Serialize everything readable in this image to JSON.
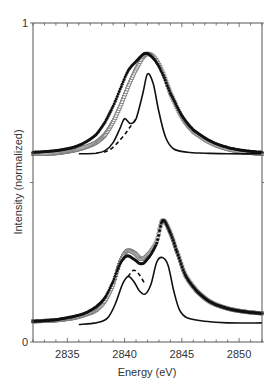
{
  "chart_data": {
    "type": "line",
    "title": "",
    "xlabel": "Energy (eV)",
    "ylabel": "Intensity (normalized)",
    "xlim": [
      2832,
      2852
    ],
    "ylim": [
      0,
      1
    ],
    "x_ticks": [
      2835,
      2840,
      2845,
      2850
    ],
    "x_tick_labels": [
      "2835",
      "2840",
      "2845",
      "2850"
    ],
    "y_ticks": [
      0,
      0.5,
      1
    ],
    "y_tick_labels": [
      "0",
      "",
      "1"
    ],
    "grid": false,
    "legend": null,
    "panels": [
      {
        "name": "upper",
        "series": [
          {
            "name": "filled-markers",
            "style": "filled-circles",
            "x": [
              2832.0,
              2834,
              2835.5,
              2836.5,
              2837.5,
              2838.3,
              2839.0,
              2839.7,
              2840.3,
              2841.0,
              2841.8,
              2842.5,
              2843.2,
              2844.0,
              2845.0,
              2846.0,
              2847.5,
              2849.0,
              2850.5,
              2852.0
            ],
            "y": [
              0.595,
              0.6,
              0.61,
              0.625,
              0.65,
              0.69,
              0.74,
              0.8,
              0.85,
              0.88,
              0.905,
              0.89,
              0.85,
              0.78,
              0.71,
              0.665,
              0.63,
              0.61,
              0.6,
              0.595
            ]
          },
          {
            "name": "open-markers",
            "style": "open-squares",
            "x": [
              2832.0,
              2834,
              2835.5,
              2836.5,
              2837.5,
              2838.3,
              2839.0,
              2839.7,
              2840.3,
              2841.0,
              2841.8,
              2842.5,
              2843.2,
              2844.0,
              2845.0,
              2846.0,
              2847.5,
              2849.0,
              2850.5,
              2852.0
            ],
            "y": [
              0.59,
              0.592,
              0.6,
              0.61,
              0.625,
              0.65,
              0.69,
              0.745,
              0.8,
              0.855,
              0.9,
              0.895,
              0.855,
              0.78,
              0.705,
              0.66,
              0.625,
              0.605,
              0.595,
              0.59
            ]
          },
          {
            "name": "solid-line",
            "style": "solid",
            "x": [
              2836.0,
              2837.5,
              2838.3,
              2839.0,
              2839.6,
              2840.0,
              2840.5,
              2841.0,
              2841.6,
              2842.0,
              2842.5,
              2843.0,
              2843.6,
              2844.3,
              2845.5,
              2847.0,
              2849.0,
              2852.0
            ],
            "y": [
              0.59,
              0.592,
              0.6,
              0.625,
              0.67,
              0.7,
              0.685,
              0.7,
              0.78,
              0.84,
              0.81,
              0.72,
              0.64,
              0.605,
              0.595,
              0.592,
              0.59,
              0.59
            ]
          },
          {
            "name": "dashed-line",
            "style": "dashed",
            "x": [
              2838.2,
              2838.8,
              2839.4,
              2840.0,
              2840.5,
              2841.0
            ],
            "y": [
              0.595,
              0.605,
              0.625,
              0.65,
              0.675,
              0.7
            ]
          }
        ]
      },
      {
        "name": "lower",
        "series": [
          {
            "name": "filled-markers",
            "style": "filled-circles",
            "x": [
              2832.0,
              2834,
              2835.5,
              2836.5,
              2837.5,
              2838.3,
              2839.0,
              2839.6,
              2840.2,
              2840.8,
              2841.5,
              2842.2,
              2842.8,
              2843.3,
              2843.9,
              2844.5,
              2845.3,
              2846.3,
              2847.5,
              2849.0,
              2850.5,
              2852.0
            ],
            "y": [
              0.065,
              0.07,
              0.08,
              0.09,
              0.11,
              0.14,
              0.19,
              0.245,
              0.27,
              0.26,
              0.245,
              0.27,
              0.31,
              0.38,
              0.35,
              0.29,
              0.21,
              0.16,
              0.125,
              0.105,
              0.095,
              0.09
            ]
          },
          {
            "name": "open-markers",
            "style": "open-squares",
            "x": [
              2832.0,
              2834,
              2835.5,
              2836.5,
              2837.5,
              2838.3,
              2839.0,
              2839.6,
              2840.2,
              2840.8,
              2841.5,
              2842.2,
              2842.8,
              2843.3,
              2843.9,
              2844.5,
              2845.3,
              2846.3,
              2847.5,
              2849.0,
              2850.5,
              2852.0
            ],
            "y": [
              0.065,
              0.068,
              0.075,
              0.085,
              0.1,
              0.13,
              0.18,
              0.25,
              0.285,
              0.28,
              0.26,
              0.28,
              0.315,
              0.38,
              0.35,
              0.29,
              0.21,
              0.16,
              0.125,
              0.105,
              0.095,
              0.09
            ]
          },
          {
            "name": "solid-line",
            "style": "solid",
            "x": [
              2836.0,
              2837.5,
              2838.5,
              2839.2,
              2839.8,
              2840.3,
              2840.8,
              2841.3,
              2841.8,
              2842.3,
              2842.8,
              2843.3,
              2843.8,
              2844.3,
              2844.8,
              2845.5,
              2847.0,
              2849.0,
              2852.0
            ],
            "y": [
              0.055,
              0.06,
              0.075,
              0.12,
              0.18,
              0.205,
              0.19,
              0.16,
              0.15,
              0.18,
              0.25,
              0.265,
              0.24,
              0.16,
              0.1,
              0.075,
              0.065,
              0.06,
              0.06
            ]
          },
          {
            "name": "dashed-line",
            "style": "dashed",
            "x": [
              2840.3,
              2840.8,
              2841.3,
              2841.8
            ],
            "y": [
              0.205,
              0.225,
              0.21,
              0.18
            ]
          }
        ]
      }
    ],
    "annotations": []
  },
  "colors": {
    "axis": "#555555",
    "series": "#111111",
    "open_marker": "#777777",
    "text": "#333333"
  }
}
